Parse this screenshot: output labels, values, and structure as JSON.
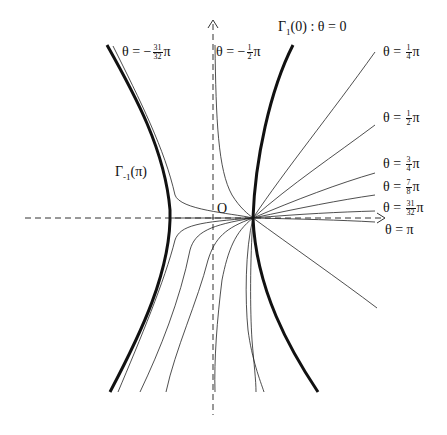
{
  "diagram": {
    "origin_label": "O",
    "axes": {
      "x_axis": {
        "style": "dashed",
        "arrow": "right"
      },
      "y_axis": {
        "style": "dashed",
        "arrow": "up"
      }
    },
    "branches": {
      "right": {
        "label_main": "Γ",
        "label_sub": "1",
        "label_arg": "(0) : θ = 0"
      },
      "left": {
        "label_main": "Γ",
        "label_sub": "-1",
        "label_arg": "(π)"
      }
    },
    "curve_labels": [
      {
        "id": "neg_31_32",
        "prefix": "θ = −",
        "num": "31",
        "den": "32",
        "suffix": "π"
      },
      {
        "id": "neg_1_2",
        "prefix": "θ = −",
        "num": "1",
        "den": "2",
        "suffix": "π"
      },
      {
        "id": "pos_1_4",
        "prefix": "θ = ",
        "num": "1",
        "den": "4",
        "suffix": "π"
      },
      {
        "id": "pos_1_2",
        "prefix": "θ = ",
        "num": "1",
        "den": "2",
        "suffix": "π"
      },
      {
        "id": "pos_3_4",
        "prefix": "θ = ",
        "num": "3",
        "den": "4",
        "suffix": "π"
      },
      {
        "id": "pos_7_8",
        "prefix": "θ = ",
        "num": "7",
        "den": "8",
        "suffix": "π"
      },
      {
        "id": "pos_31_32",
        "prefix": "θ = ",
        "num": "31",
        "den": "32",
        "suffix": "π"
      },
      {
        "id": "pi",
        "prefix": "θ = π",
        "num": "",
        "den": "",
        "suffix": ""
      }
    ],
    "colors": {
      "ink": "#111111",
      "axis": "#333333",
      "background": "#ffffff"
    }
  }
}
